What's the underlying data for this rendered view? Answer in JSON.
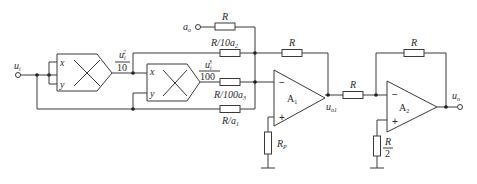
{
  "diagram": {
    "type": "circuit-schematic",
    "input": {
      "label": "u",
      "sub": "i"
    },
    "aux_input": {
      "label": "a",
      "sub": "o"
    },
    "output": {
      "label": "u",
      "sub": "o"
    },
    "multipliers": [
      {
        "id": "M1",
        "input_x": "x",
        "input_y": "y",
        "output_num": "u",
        "output_num_sub": "i",
        "output_num_sup": "2",
        "output_den": "10"
      },
      {
        "id": "M2",
        "input_x": "x",
        "input_y": "y",
        "output_num": "u",
        "output_num_sub": "i",
        "output_num_sup": "3",
        "output_den": "100"
      }
    ],
    "resistors": {
      "r_a0": "R",
      "r_a2": "R/10a",
      "r_a2_sub": "2",
      "r_a3": "R/100a",
      "r_a3_sub": "3",
      "r_a1": "R/a",
      "r_a1_sub": "1",
      "r_f1": "R",
      "r_p": "R",
      "r_p_sub": "P",
      "r_in2": "R",
      "r_f2": "R",
      "r_p2_num": "R",
      "r_p2_den": "2"
    },
    "opamps": [
      {
        "name": "A",
        "sub": "1",
        "minus": "−",
        "plus": "+",
        "output_label": "u",
        "output_sub": "o1"
      },
      {
        "name": "A",
        "sub": "2",
        "minus": "−",
        "plus": "+"
      }
    ]
  }
}
